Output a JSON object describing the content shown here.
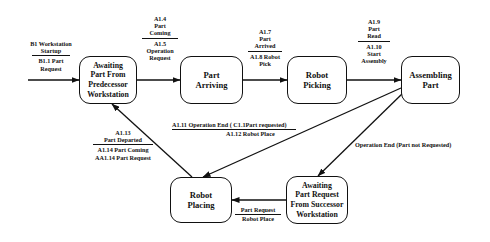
{
  "diagram": {
    "type": "state-transition",
    "states": [
      {
        "id": "s1",
        "label": "Awaiting Part From Predecessor Workstation"
      },
      {
        "id": "s2",
        "label": "Part Arriving"
      },
      {
        "id": "s3",
        "label": "Robot Picking"
      },
      {
        "id": "s4",
        "label": "Assembling Part"
      },
      {
        "id": "s5",
        "label": "Robot Placing"
      },
      {
        "id": "s6",
        "label": "Awaiting Part Request From Successor Workstation"
      }
    ],
    "transitions": [
      {
        "id": "t0",
        "from": "start",
        "to": "s1",
        "event": "B1 Workstation Startup",
        "action": "B1.1 Part Request"
      },
      {
        "id": "t1",
        "from": "s1",
        "to": "s2",
        "event": "A1.4 Part Coming",
        "action": "A1.5 Operation Request"
      },
      {
        "id": "t2",
        "from": "s2",
        "to": "s3",
        "event": "A1.7 Part Arrived",
        "action": "A1.8 Robot Pick"
      },
      {
        "id": "t3",
        "from": "s3",
        "to": "s4",
        "event": "A1.9 Part Read",
        "action": "A1.10 Start Assembly"
      },
      {
        "id": "t4",
        "from": "s4",
        "to": "s5",
        "event": "A1.11 Operation End ( C1.1Part requested)",
        "action": "A1.12 Robot Place"
      },
      {
        "id": "t5",
        "from": "s4",
        "to": "s6",
        "event": "Operation End  (Part not Requested)",
        "action": ""
      },
      {
        "id": "t6",
        "from": "s6",
        "to": "s5",
        "event": "Part Request",
        "action": "Robot Place"
      },
      {
        "id": "t7",
        "from": "s5",
        "to": "s1",
        "event": "A1.13 Part Departed",
        "action": "A1.14 Part Coming AA1.14 Part Request"
      }
    ]
  },
  "labels": {
    "t0_top_1": "B1 Workstation",
    "t0_top_2": "Startup",
    "t0_bot_1": "B1.1 Part",
    "t0_bot_2": "Request",
    "t1_top_1": "A1.4",
    "t1_top_2": "Part",
    "t1_top_3": "Coming",
    "t1_bot_1": "A1.5",
    "t1_bot_2": "Operation",
    "t1_bot_3": "Request",
    "t2_top_1": "A1.7",
    "t2_top_2": "Part",
    "t2_top_3": "Arrived",
    "t2_bot_1": "A1.8 Robot",
    "t2_bot_2": "Pick",
    "t3_top_1": "A1.9",
    "t3_top_2": "Part",
    "t3_top_3": "Read",
    "t3_bot_1": "A1.10",
    "t3_bot_2": "Start",
    "t3_bot_3": "Assembly",
    "t4_top": "A1.11 Operation End ( C1.1Part requested)",
    "t4_bot": "A1.12 Robot Place",
    "t5": "Operation End  (Part not Requested)",
    "t6_top": "Part Request",
    "t6_bot": "Robot Place",
    "t7_top_1": "A1.13",
    "t7_top_2": "Part Departed",
    "t7_bot_1": "A1.14 Part Coming",
    "t7_bot_2": "AA1.14 Part Request"
  },
  "state_lines": {
    "s1": [
      "Awaiting",
      "Part From",
      "Predecessor",
      "Workstation"
    ],
    "s2": [
      "Part",
      "Arriving"
    ],
    "s3": [
      "Robot",
      "Picking"
    ],
    "s4": [
      "Assembling",
      "Part"
    ],
    "s5": [
      "Robot",
      "Placing"
    ],
    "s6": [
      "Awaiting",
      "Part Request",
      "From Successor",
      "Workstation"
    ]
  },
  "colors": {
    "line": "#111111",
    "background": "#ffffff"
  }
}
